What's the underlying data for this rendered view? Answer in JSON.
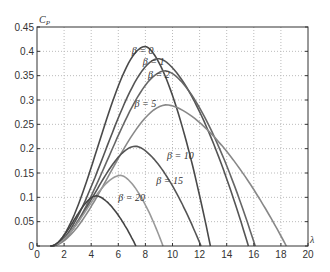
{
  "chart_data": {
    "type": "line",
    "title": "",
    "xlabel": "λ",
    "ylabel": "C_P",
    "xlim": [
      0,
      20
    ],
    "ylim": [
      0,
      0.45
    ],
    "xticks": [
      0,
      2,
      4,
      6,
      8,
      10,
      12,
      14,
      16,
      18,
      20
    ],
    "yticks": [
      0,
      0.05,
      0.1,
      0.15,
      0.2,
      0.25,
      0.3,
      0.35,
      0.4,
      0.45
    ],
    "xtick_labels": [
      "0",
      "2",
      "4",
      "6",
      "8",
      "10",
      "12",
      "14",
      "16",
      "18",
      "20"
    ],
    "ytick_labels": [
      "0",
      "0.05",
      "0.1",
      "0.15",
      "0.2",
      "0.25",
      "0.3",
      "0.35",
      "0.4",
      "0.45"
    ],
    "grid": true,
    "legend": "inline labels",
    "series": [
      {
        "name": "β = 0",
        "label": "β = 0",
        "color": "#4a4a4a",
        "start": 1.0,
        "peak_x": 8.0,
        "peak_y": 0.41,
        "end": 12.8,
        "label_pos": [
          7.0,
          0.395
        ]
      },
      {
        "name": "β = 1",
        "label": "β = 1",
        "color": "#555555",
        "start": 1.0,
        "peak_x": 9.0,
        "peak_y": 0.385,
        "end": 15.6,
        "label_pos": [
          7.8,
          0.372
        ]
      },
      {
        "name": "β = 2",
        "label": "β = 2",
        "color": "#666666",
        "start": 1.0,
        "peak_x": 9.5,
        "peak_y": 0.36,
        "end": 16.1,
        "label_pos": [
          8.2,
          0.345
        ]
      },
      {
        "name": "β = 5",
        "label": "β = 5",
        "color": "#888888",
        "start": 1.0,
        "peak_x": 9.6,
        "peak_y": 0.29,
        "end": 18.4,
        "label_pos": [
          7.2,
          0.285
        ]
      },
      {
        "name": "β = 10",
        "label": "β = 10",
        "color": "#555555",
        "start": 1.0,
        "peak_x": 7.3,
        "peak_y": 0.205,
        "end": 12.1,
        "label_pos": [
          9.6,
          0.178
        ]
      },
      {
        "name": "β = 15",
        "label": "β = 15",
        "color": "#999999",
        "start": 1.0,
        "peak_x": 6.2,
        "peak_y": 0.145,
        "end": 9.3,
        "label_pos": [
          8.8,
          0.128
        ]
      },
      {
        "name": "β = 20",
        "label": "β = 20",
        "color": "#444444",
        "start": 1.0,
        "peak_x": 4.4,
        "peak_y": 0.103,
        "end": 7.3,
        "label_pos": [
          6.0,
          0.092
        ]
      }
    ]
  }
}
